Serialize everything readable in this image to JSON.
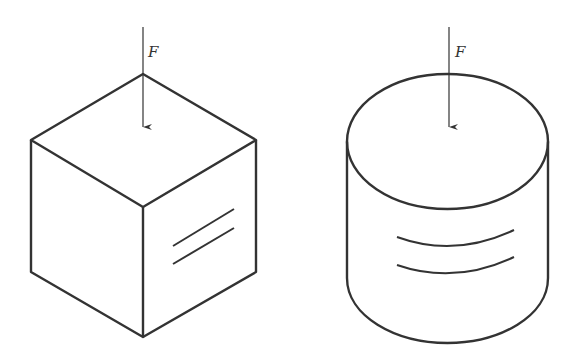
{
  "figure": {
    "colors": {
      "stroke": "#333333",
      "background": "#ffffff"
    },
    "cube": {
      "force_label": "F",
      "force_direction": "downward",
      "surface_marks": "two parallel straight lines on right face"
    },
    "cylinder": {
      "force_label": "F",
      "force_direction": "downward",
      "surface_marks": "two parallel curved lines on side surface"
    }
  }
}
